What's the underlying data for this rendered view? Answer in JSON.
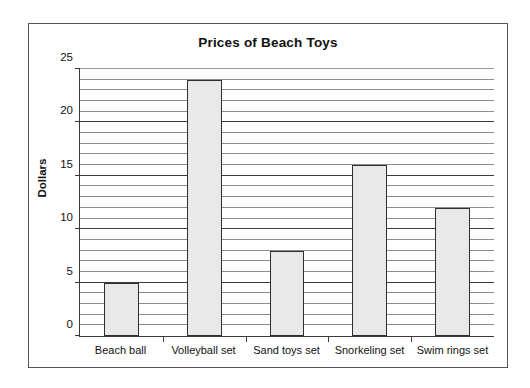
{
  "chart_data": {
    "type": "bar",
    "title": "Prices of Beach Toys",
    "xlabel": "",
    "ylabel": "Dollars",
    "categories": [
      "Beach ball",
      "Volleyball set",
      "Sand toys set",
      "Snorkeling set",
      "Swim rings set"
    ],
    "values": [
      5,
      24,
      8,
      16,
      12
    ],
    "ylim": [
      0,
      25
    ],
    "ytick_labels": [
      "0",
      "5",
      "10",
      "15",
      "20",
      "25"
    ],
    "ytick_values": [
      0,
      5,
      10,
      15,
      20,
      25
    ],
    "minor_grid_step": 1,
    "grid": true,
    "legend": null,
    "legend_position": "none",
    "colors": {
      "bar_fill": "#e9e9e9",
      "bar_border": "#2f2f2f",
      "grid_minor": "#8d8d8d",
      "grid_major": "#3c3c3c",
      "axis": "#3a3a3a",
      "frame": "#555555",
      "text": "#111111",
      "background": "#ffffff"
    }
  }
}
